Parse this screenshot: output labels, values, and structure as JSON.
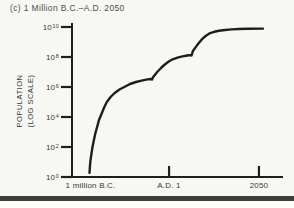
{
  "colors": {
    "background": "#f7f7f4",
    "ink": "#1e1e1e",
    "label": "#373737",
    "title": "#4e4e4e",
    "divider": "#3e3e3c"
  },
  "header": {
    "title": "(c) 1 Million B.C.–A.D. 2050"
  },
  "chart_data": {
    "type": "line",
    "title": "(c) 1 Million B.C.–A.D. 2050",
    "ylabel": "POPULATION (LOG SCALE)",
    "ylabel_lines": [
      "POPULATION",
      "(LOG SCALE)"
    ],
    "y_scale": "log10",
    "ylim_log10": [
      0,
      10
    ],
    "grid": false,
    "legend": "none",
    "y_ticks": [
      {
        "base": "10",
        "exp": "10",
        "log10": 10
      },
      {
        "base": "10",
        "exp": "8",
        "log10": 8
      },
      {
        "base": "10",
        "exp": "6",
        "log10": 6
      },
      {
        "base": "10",
        "exp": "4",
        "log10": 4
      },
      {
        "base": "10",
        "exp": "2",
        "log10": 2
      },
      {
        "base": "10",
        "exp": "0",
        "log10": 0
      }
    ],
    "x_ticks": [
      {
        "label": "1 million B.C.",
        "frac": 0.088,
        "tick_mark": false
      },
      {
        "label": "A.D. 1",
        "frac": 0.46,
        "tick_mark": true
      },
      {
        "label": "2050",
        "frac": 0.886,
        "tick_mark": true
      }
    ],
    "series": [
      {
        "name": "World population (frac of x-axis, log10 population)",
        "points": [
          [
            0.083,
            0.27
          ],
          [
            0.085,
            0.67
          ],
          [
            0.087,
            1.07
          ],
          [
            0.092,
            1.53
          ],
          [
            0.096,
            1.93
          ],
          [
            0.103,
            2.4
          ],
          [
            0.11,
            2.87
          ],
          [
            0.119,
            3.33
          ],
          [
            0.128,
            3.8
          ],
          [
            0.14,
            4.2
          ],
          [
            0.151,
            4.6
          ],
          [
            0.165,
            5.0
          ],
          [
            0.183,
            5.33
          ],
          [
            0.202,
            5.6
          ],
          [
            0.225,
            5.83
          ],
          [
            0.248,
            6.0
          ],
          [
            0.275,
            6.2
          ],
          [
            0.303,
            6.33
          ],
          [
            0.33,
            6.43
          ],
          [
            0.358,
            6.51
          ],
          [
            0.376,
            6.53
          ],
          [
            0.379,
            6.5
          ],
          [
            0.385,
            6.67
          ],
          [
            0.404,
            7.0
          ],
          [
            0.422,
            7.27
          ],
          [
            0.44,
            7.5
          ],
          [
            0.459,
            7.7
          ],
          [
            0.477,
            7.85
          ],
          [
            0.5,
            7.96
          ],
          [
            0.523,
            8.04
          ],
          [
            0.546,
            8.1
          ],
          [
            0.564,
            8.13
          ],
          [
            0.567,
            8.11
          ],
          [
            0.573,
            8.4
          ],
          [
            0.587,
            8.67
          ],
          [
            0.601,
            8.93
          ],
          [
            0.615,
            9.17
          ],
          [
            0.633,
            9.4
          ],
          [
            0.651,
            9.57
          ],
          [
            0.674,
            9.68
          ],
          [
            0.697,
            9.75
          ],
          [
            0.725,
            9.8
          ],
          [
            0.757,
            9.84
          ],
          [
            0.789,
            9.87
          ],
          [
            0.835,
            9.88
          ],
          [
            0.905,
            9.89
          ]
        ]
      }
    ]
  }
}
